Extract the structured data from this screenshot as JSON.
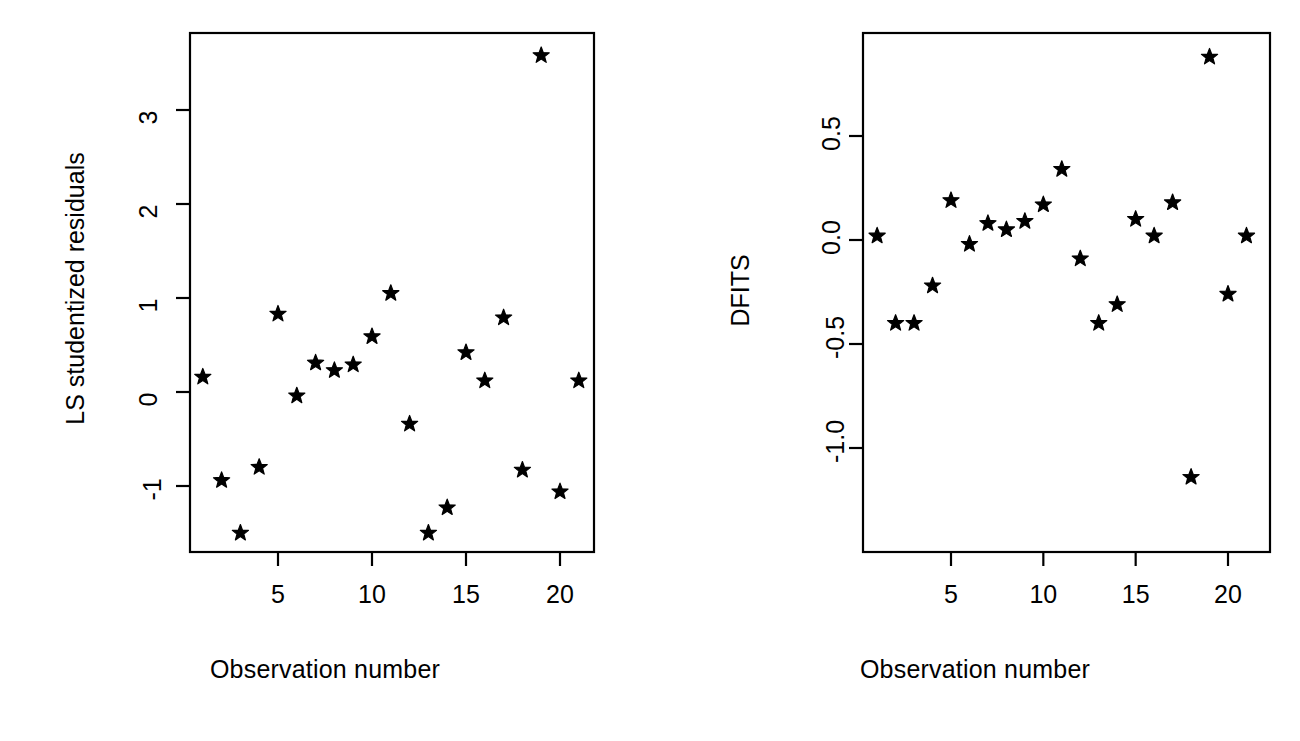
{
  "figure": {
    "background_color": "#ffffff",
    "foreground_color": "#000000",
    "marker_glyph": "star"
  },
  "chart_data": [
    {
      "type": "scatter",
      "title": "",
      "xlabel": "Observation number",
      "ylabel": "LS studentized residuals",
      "xlim": [
        0.0,
        21.95
      ],
      "ylim": [
        -1.75,
        3.85
      ],
      "xticks": [
        5,
        10,
        15,
        20
      ],
      "xtick_labels": [
        "5",
        "10",
        "15",
        "20"
      ],
      "yticks": [
        -1,
        0,
        1,
        2,
        3
      ],
      "ytick_labels": [
        "-1",
        "0",
        "1",
        "2",
        "3"
      ],
      "grid": false,
      "legend": "none",
      "marker": "star",
      "marker_color": "#000000",
      "x": [
        1,
        2,
        3,
        4,
        5,
        6,
        7,
        8,
        9,
        10,
        11,
        12,
        13,
        14,
        15,
        16,
        17,
        18,
        19,
        20,
        21
      ],
      "y": [
        0.16,
        -0.94,
        -1.5,
        -0.8,
        0.83,
        -0.04,
        0.31,
        0.23,
        0.29,
        0.59,
        1.05,
        -0.34,
        -1.5,
        -1.23,
        0.42,
        0.12,
        0.79,
        -0.83,
        3.58,
        -1.06,
        0.12
      ]
    },
    {
      "type": "scatter",
      "title": "",
      "xlabel": "Observation number",
      "ylabel": "DFITS",
      "xlim": [
        0.0,
        21.95
      ],
      "ylim": [
        -1.27,
        0.96
      ],
      "xticks": [
        5,
        10,
        15,
        20
      ],
      "xtick_labels": [
        "5",
        "10",
        "15",
        "20"
      ],
      "yticks": [
        -1.0,
        -0.5,
        0.0,
        0.5
      ],
      "ytick_labels": [
        "-1.0",
        "-0.5",
        "0.0",
        "0.5"
      ],
      "grid": false,
      "legend": "none",
      "marker": "star",
      "marker_color": "#000000",
      "x": [
        1,
        2,
        3,
        4,
        5,
        6,
        7,
        8,
        9,
        10,
        11,
        12,
        13,
        14,
        15,
        16,
        17,
        18,
        19,
        20,
        21
      ],
      "y": [
        0.02,
        -0.4,
        -0.4,
        -0.22,
        0.19,
        -0.02,
        0.08,
        0.05,
        0.09,
        0.17,
        0.34,
        -0.09,
        -0.4,
        -0.31,
        0.1,
        0.02,
        0.18,
        -1.14,
        0.88,
        -0.26,
        0.02
      ]
    }
  ],
  "panels": [
    {
      "name": "ls-studentized-residuals",
      "y_axis_title": "LS studentized residuals",
      "x_axis_title": "Observation number"
    },
    {
      "name": "dfits",
      "y_axis_title": "DFITS",
      "x_axis_title": "Observation number"
    }
  ]
}
